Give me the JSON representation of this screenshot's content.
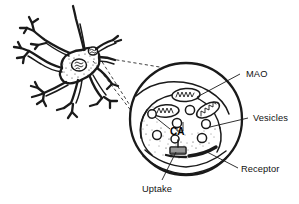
{
  "figure": {
    "background_color": "#ffffff",
    "ink_color": "#1a1a1a"
  },
  "labels": {
    "mao": "MAO",
    "vesicles": "Vesicles",
    "receptor": "Receptor",
    "uptake": "Uptake",
    "ca": "CA"
  },
  "parts": {
    "neuron_soma": "neuron-cell-body",
    "dendrites": "dendritic-branches",
    "axon": "axon",
    "magnifier_circle": "magnified-terminal-circle",
    "mitochondria_count": 3,
    "vesicle_count": 7,
    "synaptic_cleft": "synaptic-cleft",
    "uptake_transporter": "uptake-transporter",
    "receptor_bar": "postsynaptic-receptor-band",
    "zoom_lines": "dashed-magnification-cone"
  }
}
